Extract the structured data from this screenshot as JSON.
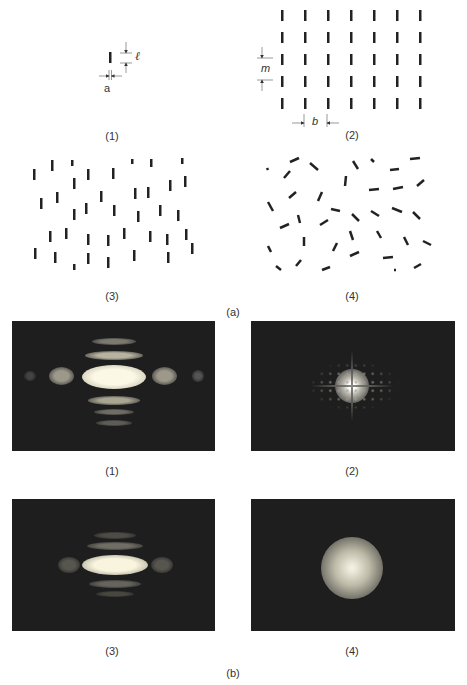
{
  "figure": {
    "part_a_label": "(a)",
    "part_b_label": "(b)",
    "part_a": {
      "panels": [
        {
          "id": "1",
          "label": "(1)",
          "description": "single slit aperture",
          "dims": {
            "length_symbol": "ℓ",
            "width_symbol": "a"
          }
        },
        {
          "id": "2",
          "label": "(2)",
          "description": "regular array of slits",
          "dims": {
            "row_spacing_symbol": "m",
            "col_spacing_symbol": "b"
          },
          "rows": 5,
          "cols": 7
        },
        {
          "id": "3",
          "label": "(3)",
          "description": "randomly positioned aligned slits"
        },
        {
          "id": "4",
          "label": "(4)",
          "description": "randomly positioned and oriented slits"
        }
      ]
    },
    "part_b": {
      "panels": [
        {
          "id": "1",
          "label": "(1)",
          "description": "diffraction pattern of single slit"
        },
        {
          "id": "2",
          "label": "(2)",
          "description": "diffraction pattern of regular array"
        },
        {
          "id": "3",
          "label": "(3)",
          "description": "diffraction pattern of random aligned slits"
        },
        {
          "id": "4",
          "label": "(4)",
          "description": "diffraction pattern of random oriented slits"
        }
      ]
    }
  },
  "colors": {
    "ink": "#222222",
    "panel_bg": "#1e1e1e",
    "glow": "#f4f0dc"
  }
}
